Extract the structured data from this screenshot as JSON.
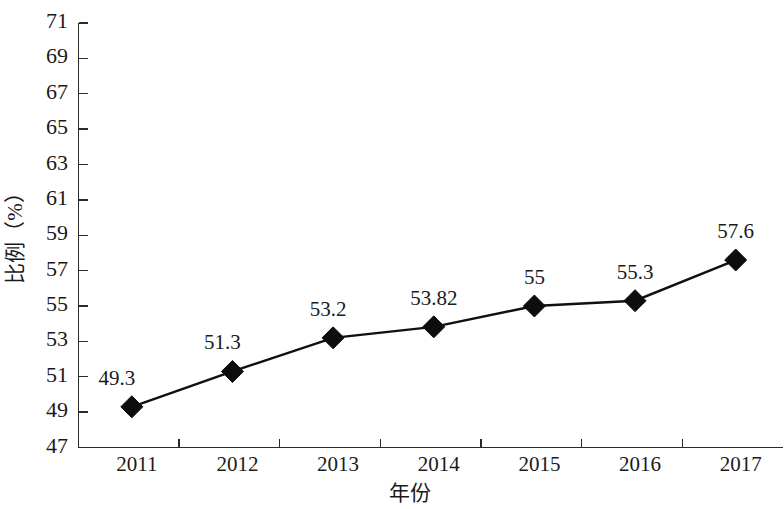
{
  "chart_data": {
    "type": "line",
    "title": "",
    "subtitle": "",
    "xlabel": "年份",
    "ylabel": "比例（%）",
    "categories": [
      "2011",
      "2012",
      "2013",
      "2014",
      "2015",
      "2016",
      "2017"
    ],
    "values": [
      49.3,
      51.3,
      53.2,
      53.82,
      55,
      55.3,
      57.6
    ],
    "point_labels": [
      "49.3",
      "51.3",
      "53.2",
      "53.82",
      "55",
      "55.3",
      "57.6"
    ],
    "series": [
      {
        "name": "",
        "values": [
          49.3,
          51.3,
          53.2,
          53.82,
          55,
          55.3,
          57.6
        ],
        "marker": "diamond",
        "color": "#0d0d0d"
      }
    ],
    "ylim": [
      47,
      71
    ],
    "ytick_step": 2,
    "ytick_labels": [
      "71",
      "69",
      "67",
      "65",
      "63",
      "61",
      "59",
      "57",
      "55",
      "53",
      "51",
      "49",
      "47"
    ],
    "grid": false,
    "legend": false,
    "legend_position": "none",
    "axis_color": "#2b2b2b",
    "background_color": "#ffffff"
  }
}
